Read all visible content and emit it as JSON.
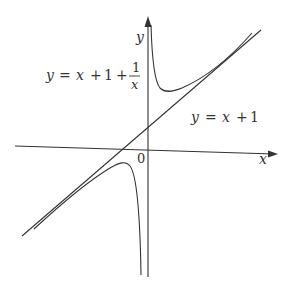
{
  "figure": {
    "type": "function-graph",
    "axes": {
      "x_label": "x",
      "y_label": "y",
      "origin_label": "0"
    },
    "curves": [
      {
        "name": "hyperbola",
        "equation_parts": {
          "lhs": "y",
          "eq": "=",
          "t1": "x",
          "p1": "+",
          "t2": "1",
          "p2": "+",
          "frac_num": "1",
          "frac_den": "x"
        },
        "expression": "y = x + 1 + 1/x"
      },
      {
        "name": "asymptote",
        "equation_parts": {
          "lhs": "y",
          "eq": "=",
          "t1": "x",
          "p1": "+",
          "t2": "1"
        },
        "expression": "y = x + 1"
      }
    ],
    "colors": {
      "ink": "#333333",
      "background": "#ffffff"
    }
  }
}
